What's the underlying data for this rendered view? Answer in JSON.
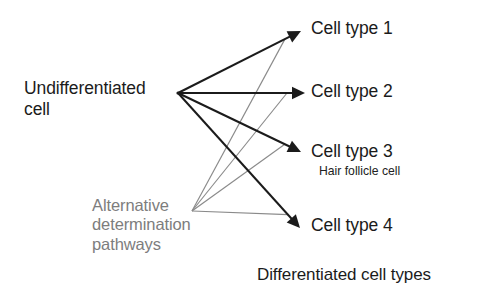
{
  "diagram": {
    "title_caption": "Differentiated cell types",
    "source_label": "Undifferentiated\ncell",
    "alternative_label": "Alternative\ndetermination\npathways",
    "colors": {
      "primary_arrow": "#1b1b1b",
      "alternative_path": "#8a8a8a",
      "text": "#1b1b1b",
      "muted_text": "#7d7d7d",
      "background": "#ffffff"
    },
    "hub": {
      "x": 178,
      "y": 93
    },
    "alt_origin": {
      "x": 192,
      "y": 211
    },
    "targets": [
      {
        "id": "cell-type-1",
        "label": "Cell type 1",
        "sublabel": "",
        "tip": {
          "x": 301,
          "y": 31
        }
      },
      {
        "id": "cell-type-2",
        "label": "Cell type 2",
        "sublabel": "",
        "tip": {
          "x": 305,
          "y": 93
        }
      },
      {
        "id": "cell-type-3",
        "label": "Cell type 3",
        "sublabel": "Hair follicle cell",
        "tip": {
          "x": 301,
          "y": 152
        }
      },
      {
        "id": "cell-type-4",
        "label": "Cell type 4",
        "sublabel": "",
        "tip": {
          "x": 300,
          "y": 228
        }
      }
    ]
  }
}
